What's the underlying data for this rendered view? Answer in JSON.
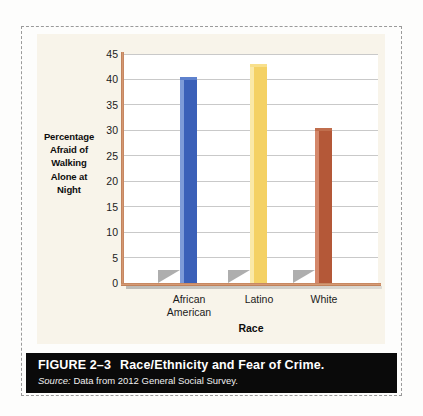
{
  "figure": {
    "caption_number": "FIGURE 2–3",
    "caption_title": "Race/Ethnicity and Fear of Crime.",
    "source_word": "Source:",
    "source_text": "Data from 2012 General Social Survey."
  },
  "chart_data": {
    "type": "bar",
    "title": "",
    "categories": [
      "African American",
      "Latino",
      "White"
    ],
    "category_lines": [
      [
        "African",
        "American"
      ],
      [
        "Latino",
        ""
      ],
      [
        "White",
        ""
      ]
    ],
    "values": [
      40.5,
      43.0,
      30.5
    ],
    "xlabel": "Race",
    "ylabel": "Percentage Afraid of Walking Alone at Night",
    "ylabel_lines": [
      "Percentage",
      "Afraid of",
      "Walking",
      "Alone at",
      "Night"
    ],
    "ylim": [
      0,
      45
    ],
    "yticks": [
      45,
      40,
      35,
      30,
      25,
      20,
      15,
      10,
      5,
      0
    ],
    "ytick_labels": [
      "45",
      "40",
      "35",
      "30",
      "25",
      "20",
      "15",
      "10",
      "5",
      "0"
    ],
    "grid": true,
    "legend": "none",
    "bar_colors": [
      "#3B60B8",
      "#F4D164",
      "#B45838"
    ],
    "bar_highlight_colors": [
      "#7E9BD8",
      "#FAE9A8",
      "#D4876A"
    ],
    "bar_cap_colors": [
      "#5E81CD",
      "#F8E08C",
      "#C06E4D"
    ],
    "axis_color": "#C98060",
    "gridline_color": "#C9C9C9",
    "plot_background": "#FFFFFF",
    "panel_background": "#F8F4EA",
    "shadow_color": "#7C7C7C"
  }
}
